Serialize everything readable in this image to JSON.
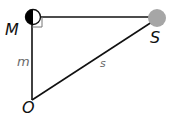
{
  "diagram": {
    "points": {
      "M": {
        "label": "M",
        "x": 33,
        "y": 17
      },
      "S": {
        "label": "S",
        "x": 157,
        "y": 18
      },
      "O": {
        "label": "O",
        "x": 32,
        "y": 100
      }
    },
    "edges": [
      {
        "from": "M",
        "to": "S",
        "label": ""
      },
      {
        "from": "M",
        "to": "O",
        "label": "m"
      },
      {
        "from": "O",
        "to": "S",
        "label": "s"
      }
    ],
    "labels": {
      "M": "M",
      "S": "S",
      "O": "O",
      "m": "m",
      "s": "s"
    },
    "right_angle_at": "M",
    "colors": {
      "line": "#111111",
      "sun": "#a6a6a6",
      "moon_dark": "#000000",
      "moon_light": "#ffffff",
      "label_main": "#111111",
      "label_edge": "#6b6b6b"
    }
  }
}
